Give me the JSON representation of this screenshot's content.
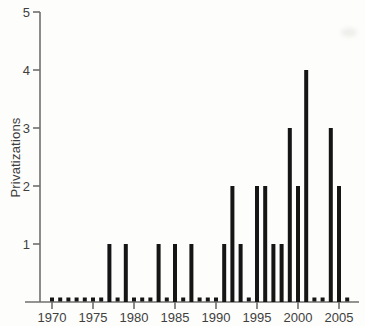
{
  "chart_data": {
    "type": "bar",
    "subtype": "stem",
    "title": "",
    "xlabel": "",
    "ylabel": "Privatizations",
    "x": [
      1970,
      1971,
      1972,
      1973,
      1974,
      1975,
      1976,
      1977,
      1978,
      1979,
      1980,
      1981,
      1982,
      1983,
      1984,
      1985,
      1986,
      1987,
      1988,
      1989,
      1990,
      1991,
      1992,
      1993,
      1994,
      1995,
      1996,
      1997,
      1998,
      1999,
      2000,
      2001,
      2002,
      2003,
      2004,
      2005,
      2006
    ],
    "values": [
      0,
      0,
      0,
      0,
      0,
      0,
      0,
      1,
      0,
      1,
      0,
      0,
      0,
      1,
      0,
      1,
      0,
      1,
      0,
      0,
      0,
      1,
      2,
      1,
      0,
      2,
      2,
      1,
      1,
      3,
      2,
      4,
      0,
      0,
      3,
      2,
      0
    ],
    "xticks": [
      "1970",
      "1975",
      "1980",
      "1985",
      "1990",
      "1995",
      "2000",
      "2005"
    ],
    "yticks": [
      "1",
      "2",
      "3",
      "4",
      "5"
    ],
    "ylim": [
      0,
      5
    ],
    "xlim": [
      1968,
      2007
    ],
    "grid": false,
    "legend": null,
    "colors": {
      "bar": "#151515",
      "axis": "#6f6f6f",
      "text": "#3f3f3f",
      "background": "#fdfdfb"
    }
  }
}
